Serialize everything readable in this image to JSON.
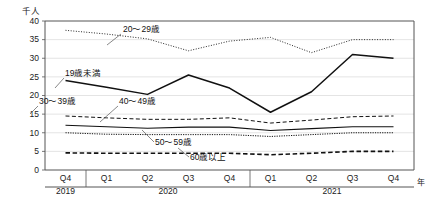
{
  "chart_data": {
    "type": "line",
    "title": "",
    "unit_label": "千人",
    "xlabel": "年",
    "ylabel": "",
    "ylim": [
      0,
      40
    ],
    "yticks": [
      0,
      5,
      10,
      15,
      20,
      25,
      30,
      35,
      40
    ],
    "grid": true,
    "legend_position": "inline-annotations",
    "x": [
      "Q4",
      "Q1",
      "Q2",
      "Q3",
      "Q4",
      "Q1",
      "Q2",
      "Q3",
      "Q4"
    ],
    "x_groups": [
      {
        "label": "2019",
        "span": 1
      },
      {
        "label": "2020",
        "span": 4
      },
      {
        "label": "2021",
        "span": 4
      }
    ],
    "categories": [
      "2019 Q4",
      "2020 Q1",
      "2020 Q2",
      "2020 Q3",
      "2020 Q4",
      "2021 Q1",
      "2021 Q2",
      "2021 Q3",
      "2021 Q4"
    ],
    "series": [
      {
        "name": "20～29歳",
        "style": "fine-dotted",
        "values": [
          37.5,
          36.5,
          35.2,
          32.0,
          34.6,
          35.6,
          31.5,
          35.0,
          35.0
        ]
      },
      {
        "name": "19歳未満",
        "style": "solid-thick",
        "values": [
          24.0,
          22.2,
          20.3,
          25.5,
          22.0,
          15.5,
          21.0,
          31.0,
          30.0
        ]
      },
      {
        "name": "30～39歳",
        "style": "dashed",
        "values": [
          14.5,
          14.0,
          13.6,
          13.6,
          14.0,
          12.6,
          13.4,
          14.3,
          14.5
        ]
      },
      {
        "name": "40～49歳",
        "style": "solid-thin",
        "values": [
          12.0,
          11.6,
          11.2,
          11.5,
          11.5,
          10.6,
          11.1,
          11.6,
          11.6
        ]
      },
      {
        "name": "50～59歳",
        "style": "dotted",
        "values": [
          10.0,
          9.6,
          9.5,
          9.5,
          9.5,
          9.0,
          9.5,
          10.0,
          10.0
        ]
      },
      {
        "name": "60歳以上",
        "style": "bold-dashed",
        "values": [
          4.6,
          4.5,
          4.5,
          4.5,
          4.5,
          4.1,
          4.5,
          5.0,
          5.0
        ]
      }
    ],
    "annotations": [
      {
        "text": "20～29歳",
        "x": 123,
        "y": 32,
        "leader": [
          [
            121,
            34
          ],
          [
            107,
            45
          ]
        ]
      },
      {
        "text": "19歳未満",
        "x": 65,
        "y": 76,
        "leader": [
          [
            64,
            78
          ],
          [
            55,
            88
          ]
        ]
      },
      {
        "text": "30～39歳",
        "x": 39,
        "y": 104,
        "leader": [
          [
            38,
            106
          ],
          [
            30,
            114
          ]
        ]
      },
      {
        "text": "40～49歳",
        "x": 119,
        "y": 104,
        "leader": [
          [
            118,
            106
          ],
          [
            100,
            122
          ]
        ]
      },
      {
        "text": "50～59歳",
        "x": 155,
        "y": 145,
        "leader": [
          [
            154,
            142
          ],
          [
            142,
            130
          ]
        ]
      },
      {
        "text": "60歳以上",
        "x": 190,
        "y": 160,
        "leader": [
          [
            189,
            157
          ],
          [
            178,
            148
          ]
        ]
      }
    ]
  }
}
